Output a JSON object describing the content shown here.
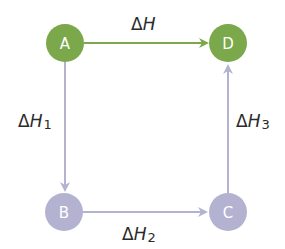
{
  "colors": {
    "green": "#7aa84a",
    "lavender": "#b3b3d1",
    "label": "#2b2b2b",
    "background": "#ffffff"
  },
  "nodes": {
    "A": {
      "label": "A",
      "x": 65,
      "y": 43,
      "color": "green"
    },
    "B": {
      "label": "B",
      "x": 64,
      "y": 212,
      "color": "lavender"
    },
    "C": {
      "label": "C",
      "x": 228,
      "y": 212,
      "color": "lavender"
    },
    "D": {
      "label": "D",
      "x": 228,
      "y": 43,
      "color": "green"
    }
  },
  "edges": {
    "AD": {
      "from": "A",
      "to": "D",
      "delta": "Δ",
      "var": "H",
      "sub": ""
    },
    "AB": {
      "from": "A",
      "to": "B",
      "delta": "Δ",
      "var": "H",
      "sub": "1"
    },
    "BC": {
      "from": "B",
      "to": "C",
      "delta": "Δ",
      "var": "H",
      "sub": "2"
    },
    "CD": {
      "from": "C",
      "to": "D",
      "delta": "Δ",
      "var": "H",
      "sub": "3"
    }
  }
}
